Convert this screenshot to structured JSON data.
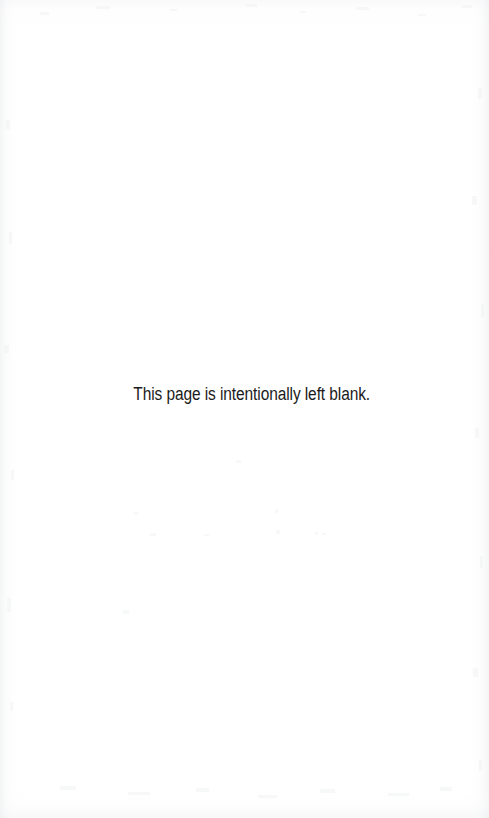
{
  "page": {
    "width": 489,
    "height": 818,
    "background_color": "#ffffff",
    "kind": "scanned-document-page"
  },
  "notice": {
    "text": "This page is intentionally left blank.",
    "color": "#1b1b1b",
    "font_size_px": 18,
    "alignment": "center",
    "position": {
      "left_px": 138,
      "top_px": 384,
      "width_px": 232,
      "height_px": 21
    }
  },
  "artifacts": {
    "description": "faint grey scanner noise along the page margins",
    "edges": [
      "top",
      "right",
      "bottom",
      "left"
    ],
    "noise_color": "#eceded"
  }
}
